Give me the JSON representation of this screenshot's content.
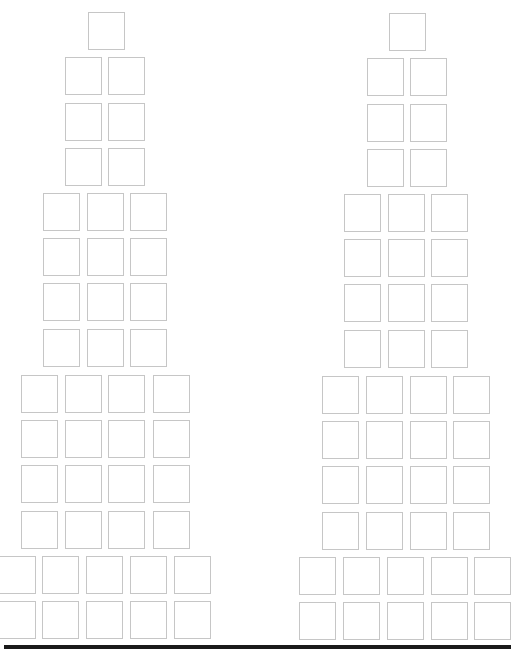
{
  "colors": {
    "background": "#ffffff",
    "box_border": "#c6c6c6",
    "bottom_bar": "#1a1a1a"
  },
  "box_size": {
    "w": 37,
    "h": 38
  },
  "towers": [
    {
      "name": "left-tower",
      "rows": [
        {
          "y": 12,
          "xs": [
            88
          ]
        },
        {
          "y": 57,
          "xs": [
            65,
            108
          ]
        },
        {
          "y": 103,
          "xs": [
            65,
            108
          ]
        },
        {
          "y": 148,
          "xs": [
            65,
            108
          ]
        },
        {
          "y": 193,
          "xs": [
            43,
            87,
            130
          ]
        },
        {
          "y": 238,
          "xs": [
            43,
            87,
            130
          ]
        },
        {
          "y": 283,
          "xs": [
            43,
            87,
            130
          ]
        },
        {
          "y": 329,
          "xs": [
            43,
            87,
            130
          ]
        },
        {
          "y": 375,
          "xs": [
            21,
            65,
            108,
            153
          ]
        },
        {
          "y": 420,
          "xs": [
            21,
            65,
            108,
            153
          ]
        },
        {
          "y": 465,
          "xs": [
            21,
            65,
            108,
            153
          ]
        },
        {
          "y": 511,
          "xs": [
            21,
            65,
            108,
            153
          ]
        },
        {
          "y": 556,
          "xs": [
            -1,
            42,
            86,
            130,
            174
          ]
        },
        {
          "y": 601,
          "xs": [
            -1,
            42,
            86,
            130,
            174
          ]
        }
      ]
    },
    {
      "name": "right-tower",
      "rows": [
        {
          "y": 13,
          "xs": [
            389
          ]
        },
        {
          "y": 58,
          "xs": [
            367,
            410
          ]
        },
        {
          "y": 104,
          "xs": [
            367,
            410
          ]
        },
        {
          "y": 149,
          "xs": [
            367,
            410
          ]
        },
        {
          "y": 194,
          "xs": [
            344,
            388,
            431
          ]
        },
        {
          "y": 239,
          "xs": [
            344,
            388,
            431
          ]
        },
        {
          "y": 284,
          "xs": [
            344,
            388,
            431
          ]
        },
        {
          "y": 330,
          "xs": [
            344,
            388,
            431
          ]
        },
        {
          "y": 376,
          "xs": [
            322,
            366,
            410,
            453
          ]
        },
        {
          "y": 421,
          "xs": [
            322,
            366,
            410,
            453
          ]
        },
        {
          "y": 466,
          "xs": [
            322,
            366,
            410,
            453
          ]
        },
        {
          "y": 512,
          "xs": [
            322,
            366,
            410,
            453
          ]
        },
        {
          "y": 557,
          "xs": [
            299,
            343,
            387,
            431,
            474
          ]
        },
        {
          "y": 602,
          "xs": [
            299,
            343,
            387,
            431,
            474
          ]
        }
      ]
    }
  ]
}
